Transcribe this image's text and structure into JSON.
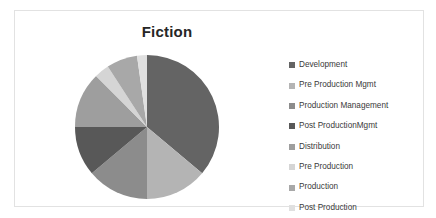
{
  "chart_data": {
    "type": "pie",
    "title": "Fiction",
    "xlabel": "",
    "ylabel": "",
    "legend_position": "right",
    "grid": false,
    "categories": [
      "Development",
      "Pre Production Mgmt",
      "Production Management",
      "Post ProductionMgmt",
      "Distribution",
      "Pre Production",
      "Production",
      "Post Production"
    ],
    "values": [
      36.1,
      13.9,
      13.9,
      11.1,
      12.5,
      3.3,
      6.9,
      2.3
    ],
    "unit": "percent",
    "start_angle_deg": 0,
    "direction": "clockwise",
    "slices": [
      {
        "label": "Development",
        "percent": 36.1,
        "angle_deg": 130,
        "color": "#646464"
      },
      {
        "label": "Pre Production Mgmt",
        "percent": 13.9,
        "angle_deg": 50,
        "color": "#b4b4b4"
      },
      {
        "label": "Production Management",
        "percent": 13.9,
        "angle_deg": 50,
        "color": "#8c8c8c"
      },
      {
        "label": "Post ProductionMgmt",
        "percent": 11.1,
        "angle_deg": 40,
        "color": "#585858"
      },
      {
        "label": "Distribution",
        "percent": 12.5,
        "angle_deg": 45,
        "color": "#9e9e9e"
      },
      {
        "label": "Pre Production",
        "percent": 3.3,
        "angle_deg": 12,
        "color": "#d5d5d5"
      },
      {
        "label": "Production",
        "percent": 6.9,
        "angle_deg": 25,
        "color": "#a8a8a8"
      },
      {
        "label": "Post Production",
        "percent": 2.3,
        "angle_deg": 8,
        "color": "#e0e0e0"
      }
    ]
  },
  "legend": {
    "items": [
      {
        "label": "Development",
        "color": "#646464"
      },
      {
        "label": "Pre Production Mgmt",
        "color": "#b4b4b4"
      },
      {
        "label": "Production Management",
        "color": "#8c8c8c"
      },
      {
        "label": "Post ProductionMgmt",
        "color": "#585858"
      },
      {
        "label": "Distribution",
        "color": "#9e9e9e"
      },
      {
        "label": "Pre Production",
        "color": "#d5d5d5"
      },
      {
        "label": "Production",
        "color": "#a8a8a8"
      },
      {
        "label": "Post Production",
        "color": "#e0e0e0"
      }
    ]
  }
}
